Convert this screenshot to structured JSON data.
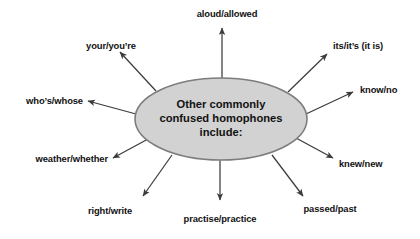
{
  "diagram": {
    "type": "radial-spoke-map",
    "background_color": "#ffffff",
    "center": {
      "shape": "ellipse",
      "fill_color": "#d2d2d2",
      "stroke_color": "#7d7d7d",
      "lines": [
        "Other commonly",
        "confused homophones",
        "include:"
      ]
    },
    "arrow_color": "#3c3c3c",
    "spokes": [
      {
        "id": "aloud-allowed",
        "label": "aloud/allowed",
        "position": "top"
      },
      {
        "id": "its-its",
        "label": "its/it’s (it is)",
        "position": "top-right"
      },
      {
        "id": "know-no",
        "label": "know/no",
        "position": "right"
      },
      {
        "id": "knew-new",
        "label": "knew/new",
        "position": "bottom-right"
      },
      {
        "id": "passed-past",
        "label": "passed/past",
        "position": "bottom-right-lower"
      },
      {
        "id": "practise-practice",
        "label": "practise/practice",
        "position": "bottom"
      },
      {
        "id": "right-write",
        "label": "right/write",
        "position": "bottom-left-lower"
      },
      {
        "id": "weather-whether",
        "label": "weather/whether",
        "position": "bottom-left"
      },
      {
        "id": "whos-whose",
        "label": "who’s/whose",
        "position": "left"
      },
      {
        "id": "your-youre",
        "label": "your/you’re",
        "position": "top-left"
      }
    ]
  }
}
